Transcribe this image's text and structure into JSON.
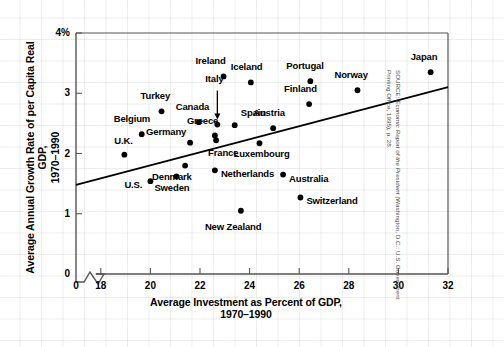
{
  "figure": {
    "source_prefix": "SOURCE: ",
    "source_italic": "Economic Report of the President",
    "source_rest": " (Washington, D.C.: U.S. Government Printing Office, 1995), p. 28."
  },
  "chart_data": {
    "type": "scatter",
    "title": "",
    "xlabel": "Average Investment as Percent of GDP,\n1970–1990",
    "ylabel": "Average Annual Growth Rate of per Capita Real GDP,\n1970–1990",
    "xlim": [
      17.0,
      32.0
    ],
    "ylim": [
      0,
      4
    ],
    "xticks": [
      18,
      20,
      22,
      24,
      26,
      28,
      30,
      32
    ],
    "xtick_labels": [
      "18",
      "20",
      "22",
      "24",
      "26",
      "28",
      "30",
      "32"
    ],
    "x_origin_label": "0",
    "x_axis_break": true,
    "yticks": [
      0,
      1,
      2,
      3,
      4
    ],
    "ytick_labels": [
      "0",
      "1",
      "2",
      "3",
      "4%"
    ],
    "grid": false,
    "legend": null,
    "marker_color": "#000000",
    "trendline": {
      "label": "regression line",
      "x": [
        17.0,
        32.0
      ],
      "y": [
        1.48,
        3.1
      ]
    },
    "points": [
      {
        "label": "Ireland",
        "x": 22.95,
        "y": 3.28,
        "label_dx": -28,
        "label_dy": -15
      },
      {
        "label": "Italy",
        "x": 22.7,
        "y": 2.48,
        "label_dx": -12,
        "label_dy": -46,
        "leader": true
      },
      {
        "label": "Iceland",
        "x": 24.05,
        "y": 3.18,
        "label_dx": -20,
        "label_dy": -15
      },
      {
        "label": "Portugal",
        "x": 26.45,
        "y": 3.2,
        "label_dx": -24,
        "label_dy": -15
      },
      {
        "label": "Norway",
        "x": 28.35,
        "y": 3.05,
        "label_dx": -23,
        "label_dy": -15
      },
      {
        "label": "Japan",
        "x": 31.3,
        "y": 3.35,
        "label_dx": -20,
        "label_dy": -15
      },
      {
        "label": "Finland",
        "x": 26.4,
        "y": 2.82,
        "label_dx": -25,
        "label_dy": -15
      },
      {
        "label": "Turkey",
        "x": 20.45,
        "y": 2.7,
        "label_dx": -21,
        "label_dy": -15
      },
      {
        "label": "Canada",
        "x": 21.95,
        "y": 2.52,
        "label_dx": -23,
        "label_dy": -15
      },
      {
        "label": "Spain",
        "x": 23.4,
        "y": 2.47,
        "label_dx": 6,
        "label_dy": -12
      },
      {
        "label": "Austria",
        "x": 24.95,
        "y": 2.42,
        "label_dx": -20,
        "label_dy": -15
      },
      {
        "label": "Belgium",
        "x": 19.65,
        "y": 2.32,
        "label_dx": -28,
        "label_dy": -15
      },
      {
        "label": "Greece",
        "x": 22.6,
        "y": 2.3,
        "label_dx": -28,
        "label_dy": -14
      },
      {
        "label": "Luxembourg",
        "x": 24.4,
        "y": 2.17,
        "label_dx": -26,
        "label_dy": 11
      },
      {
        "label": "Germany",
        "x": 21.6,
        "y": 2.18,
        "label_dx": -44,
        "label_dy": -11
      },
      {
        "label": "France",
        "x": 22.65,
        "y": 2.22,
        "label_dx": -8,
        "label_dy": 13
      },
      {
        "label": "U.K.",
        "x": 18.95,
        "y": 1.98,
        "label_dx": -10,
        "label_dy": -14
      },
      {
        "label": "Denmark",
        "x": 21.4,
        "y": 1.8,
        "label_dx": -33,
        "label_dy": 11
      },
      {
        "label": "Netherlands",
        "x": 22.6,
        "y": 1.72,
        "label_dx": 6,
        "label_dy": 4
      },
      {
        "label": "U.S.",
        "x": 20.0,
        "y": 1.54,
        "label_dx": -26,
        "label_dy": 4
      },
      {
        "label": "Sweden",
        "x": 21.05,
        "y": 1.62,
        "label_dx": -22,
        "label_dy": 12
      },
      {
        "label": "Australia",
        "x": 25.35,
        "y": 1.65,
        "label_dx": 6,
        "label_dy": 4
      },
      {
        "label": "Switzerland",
        "x": 26.05,
        "y": 1.27,
        "label_dx": 6,
        "label_dy": 4
      },
      {
        "label": "New Zealand",
        "x": 23.65,
        "y": 1.05,
        "label_dx": -36,
        "label_dy": 16
      }
    ]
  }
}
